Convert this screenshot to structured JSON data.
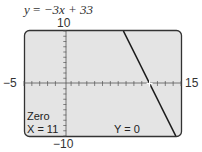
{
  "chart_data": {
    "type": "line",
    "title": "y = −3x + 33",
    "equation": {
      "slope": -3,
      "intercept": 33
    },
    "xlim": [
      -5,
      15
    ],
    "ylim": [
      -10,
      10
    ],
    "xscale": 1,
    "yscale": 1,
    "grid": false,
    "axis_labels": {
      "xmin": "−5",
      "xmax": "15",
      "ymax": "10",
      "ymin": "−10"
    },
    "series": [
      {
        "name": "y = −3x + 33",
        "x": [
          7.667,
          14.333
        ],
        "y": [
          10,
          -10
        ]
      }
    ],
    "annotations": [
      {
        "type": "cursor",
        "x": 11,
        "y": 0
      }
    ],
    "calc_result": {
      "mode": "Zero",
      "x_readout": "X = 11",
      "y_readout": "Y = 0"
    }
  },
  "header": {
    "y_var": "y",
    "equals": " = ",
    "rhs": "−3x + 33"
  },
  "labels": {
    "ymax": "10",
    "ymin": "−10",
    "xmin": "−5",
    "xmax": "15"
  },
  "screen": {
    "mode": "Zero",
    "x_readout": "X = 11",
    "y_readout": "Y = 0"
  },
  "colors": {
    "screen_bg": "#e4e4e4",
    "frame": "#333333",
    "line": "#1a1a1a"
  }
}
